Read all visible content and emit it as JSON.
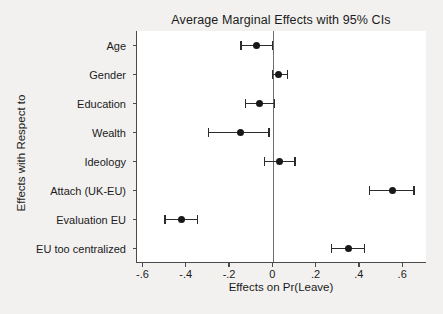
{
  "chart_data": {
    "type": "scatter",
    "title": "Average Marginal Effects with 95% CIs",
    "xlabel": "Effects on Pr(Leave)",
    "ylabel": "Effects with Respect to",
    "orientation": "horizontal",
    "grid": false,
    "legend": "none",
    "xlim": [
      -0.63,
      0.71
    ],
    "xticks": [
      -0.6,
      -0.4,
      -0.2,
      0,
      0.2,
      0.4,
      0.6
    ],
    "xticklabels": [
      "-.6",
      "-.4",
      "-.2",
      "0",
      ".2",
      ".4",
      ".6"
    ],
    "reference_line": 0,
    "categories": [
      "Age",
      "Gender",
      "Education",
      "Wealth",
      "Ideology",
      "Attach (UK-EU)",
      "Evaluation EU",
      "EU too centralized"
    ],
    "points": [
      {
        "label": "Age",
        "estimate": -0.08,
        "ci_low": -0.15,
        "ci_high": -0.005
      },
      {
        "label": "Gender",
        "estimate": 0.025,
        "ci_low": -0.005,
        "ci_high": 0.065
      },
      {
        "label": "Education",
        "estimate": -0.065,
        "ci_low": -0.13,
        "ci_high": 0.005
      },
      {
        "label": "Wealth",
        "estimate": -0.15,
        "ci_low": -0.3,
        "ci_high": -0.02
      },
      {
        "label": "Ideology",
        "estimate": 0.03,
        "ci_low": -0.04,
        "ci_high": 0.1
      },
      {
        "label": "Attach (UK-EU)",
        "estimate": 0.55,
        "ci_low": 0.445,
        "ci_high": 0.65
      },
      {
        "label": "Evaluation EU",
        "estimate": -0.425,
        "ci_low": -0.5,
        "ci_high": -0.35
      },
      {
        "label": "EU too centralized",
        "estimate": 0.345,
        "ci_low": 0.27,
        "ci_high": 0.42
      }
    ],
    "colors": {
      "marker": "#181818",
      "ci": "#2b2b2b",
      "axis": "#4a4a4a",
      "zero_line": "#6d6d6d",
      "plot_background": "#ffffff",
      "figure_background": "#f2f1ef"
    }
  }
}
